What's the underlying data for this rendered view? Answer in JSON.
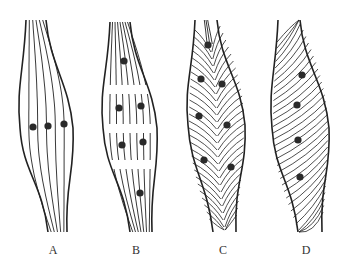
{
  "diagram": {
    "colors": {
      "stroke": "#222222",
      "dot": "#2a2a2a",
      "background": "#ffffff"
    },
    "panels": [
      {
        "label": "A",
        "label_x": 53,
        "fiber_pattern": "parallel",
        "dots": [
          [
            33,
            127
          ],
          [
            48,
            126
          ],
          [
            64,
            124
          ]
        ]
      },
      {
        "label": "B",
        "label_x": 136,
        "fiber_pattern": "segmented-parallel",
        "dots": [
          [
            124,
            61
          ],
          [
            119,
            108
          ],
          [
            141,
            106
          ],
          [
            122,
            145
          ],
          [
            143,
            142
          ],
          [
            140,
            193
          ]
        ]
      },
      {
        "label": "C",
        "label_x": 223,
        "fiber_pattern": "bipennate",
        "dots": [
          [
            208,
            45
          ],
          [
            201,
            79
          ],
          [
            222,
            84
          ],
          [
            199,
            116
          ],
          [
            227,
            125
          ],
          [
            204,
            160
          ],
          [
            231,
            167
          ]
        ]
      },
      {
        "label": "D",
        "label_x": 306,
        "fiber_pattern": "unipennate",
        "dots": [
          [
            302,
            75
          ],
          [
            297,
            105
          ],
          [
            298,
            140
          ],
          [
            300,
            177
          ]
        ]
      }
    ]
  }
}
